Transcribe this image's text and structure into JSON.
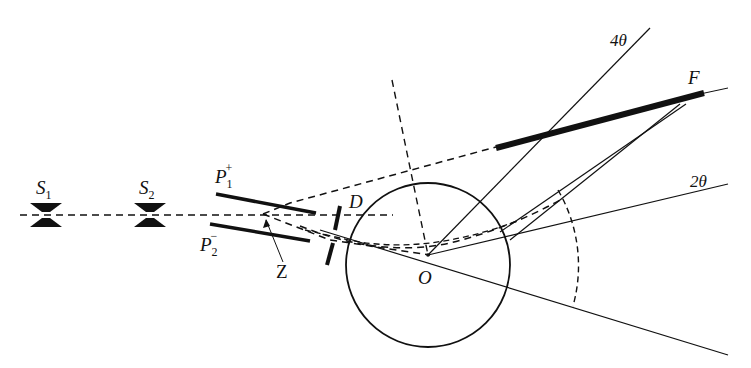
{
  "diagram": {
    "type": "physics-schematic",
    "labels": {
      "s1": {
        "base": "S",
        "sub": "1"
      },
      "s2": {
        "base": "S",
        "sub": "2"
      },
      "p1": {
        "base": "P",
        "sub": "1",
        "sup": "+"
      },
      "p2": {
        "base": "P",
        "sub": "2",
        "sup": "−"
      },
      "z": "Z",
      "d": "D",
      "o": "O",
      "f": "F",
      "angle_4theta": "4θ",
      "angle_2theta": "2θ"
    },
    "colors": {
      "stroke": "#111111",
      "background": "#ffffff"
    }
  }
}
